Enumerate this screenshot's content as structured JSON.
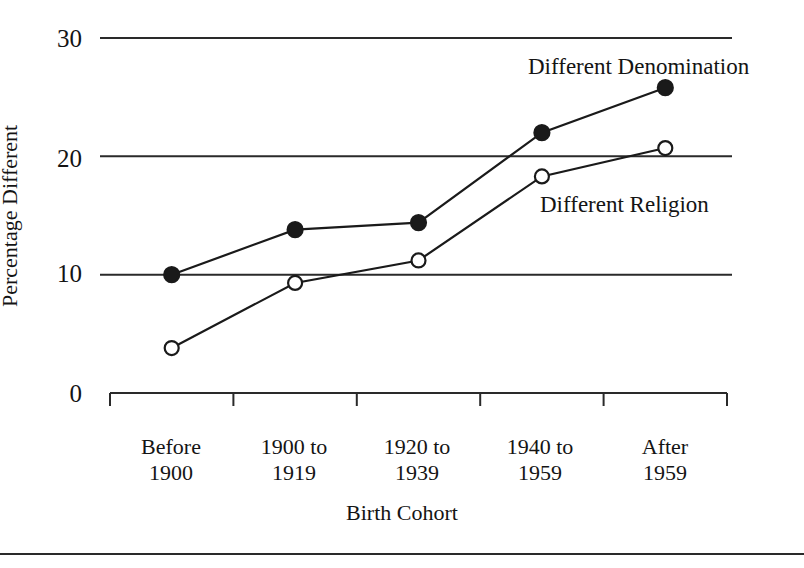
{
  "chart_data": {
    "type": "line",
    "title": "",
    "xlabel": "Birth Cohort",
    "ylabel": "Percentage Different",
    "categories": [
      "Before 1900",
      "1900 to 1919",
      "1920 to 1939",
      "1940 to 1959",
      "After 1959"
    ],
    "category_lines": [
      [
        "Before",
        "1900"
      ],
      [
        "1900 to",
        "1919"
      ],
      [
        "1920 to",
        "1939"
      ],
      [
        "1940 to",
        "1959"
      ],
      [
        "After",
        "1959"
      ]
    ],
    "series": [
      {
        "name": "Different Denomination",
        "marker": "filled-circle",
        "values": [
          10.0,
          13.8,
          14.4,
          22.0,
          25.8
        ]
      },
      {
        "name": "Different Religion",
        "marker": "open-circle",
        "values": [
          3.8,
          9.3,
          11.2,
          18.3,
          20.7
        ]
      }
    ],
    "ylim": [
      0,
      30
    ],
    "yticks": [
      0,
      10,
      20,
      30
    ],
    "ytick_labels": [
      "0",
      "10",
      "20",
      "30"
    ],
    "grid": "horizontal",
    "legend": "inline-annotations",
    "annotations": [
      {
        "text": "Different Denomination",
        "x": 528,
        "y": 54
      },
      {
        "text": "Different Religion",
        "x": 540,
        "y": 192
      }
    ],
    "line_color": "#1a1a1a",
    "grid_color": "#2a2a2a",
    "background": "#ffffff"
  }
}
